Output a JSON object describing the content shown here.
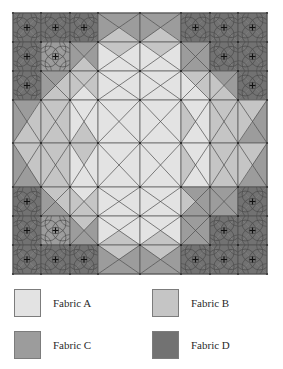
{
  "fabrics": {
    "A": {
      "label": "Fabric A",
      "color": "#e3e3e3"
    },
    "B": {
      "label": "Fabric B",
      "color": "#c5c5c5"
    },
    "C": {
      "label": "Fabric C",
      "color": "#9c9c9c"
    },
    "D": {
      "label": "Fabric D",
      "color": "#727272"
    }
  },
  "quilt": {
    "x_edges": [
      13,
      41,
      70,
      98,
      140,
      181,
      210,
      238,
      267
    ],
    "y_edges": [
      13,
      42,
      71,
      100,
      143,
      187,
      216,
      245,
      274
    ],
    "line_color": "#4a4a4a",
    "cells": [
      [
        {
          "t": "o",
          "f": "DDDD"
        },
        {
          "t": "o",
          "f": "DDDD"
        },
        {
          "t": "o",
          "f": "DDDD"
        },
        {
          "t": "x",
          "f": "CCBC"
        },
        {
          "t": "x",
          "f": "CCBC"
        },
        {
          "t": "o",
          "f": "DDDD"
        },
        {
          "t": "o",
          "f": "DDDD"
        },
        {
          "t": "o",
          "f": "DDDD"
        }
      ],
      [
        {
          "t": "o",
          "f": "DDDD"
        },
        {
          "t": "o",
          "f": "CCCC"
        },
        {
          "t": "x",
          "f": "CCBC"
        },
        {
          "t": "x",
          "f": "BAAA"
        },
        {
          "t": "x",
          "f": "BAAA"
        },
        {
          "t": "x",
          "f": "CCCC"
        },
        {
          "t": "o",
          "f": "DDDD"
        },
        {
          "t": "o",
          "f": "DDDD"
        }
      ],
      [
        {
          "t": "o",
          "f": "DDDD"
        },
        {
          "t": "x",
          "f": "CBBC"
        },
        {
          "t": "x",
          "f": "BBAB"
        },
        {
          "t": "x",
          "f": "AAAA"
        },
        {
          "t": "x",
          "f": "AAAA"
        },
        {
          "t": "x",
          "f": "BBAA"
        },
        {
          "t": "x",
          "f": "CCBB"
        },
        {
          "t": "o",
          "f": "DDDD"
        }
      ],
      [
        {
          "t": "x",
          "f": "CBBC"
        },
        {
          "t": "x",
          "f": "BBBB"
        },
        {
          "t": "x",
          "f": "AABA"
        },
        {
          "t": "x",
          "f": "AAAA"
        },
        {
          "t": "x",
          "f": "AAAA"
        },
        {
          "t": "x",
          "f": "AAAB"
        },
        {
          "t": "x",
          "f": "BBBB"
        },
        {
          "t": "x",
          "f": "BCCB"
        }
      ],
      [
        {
          "t": "x",
          "f": "BBCC"
        },
        {
          "t": "x",
          "f": "BBBB"
        },
        {
          "t": "x",
          "f": "BAAA"
        },
        {
          "t": "x",
          "f": "AAAA"
        },
        {
          "t": "x",
          "f": "AAAA"
        },
        {
          "t": "x",
          "f": "AAAB"
        },
        {
          "t": "x",
          "f": "BBBB"
        },
        {
          "t": "x",
          "f": "BCCB"
        }
      ],
      [
        {
          "t": "o",
          "f": "DDDD"
        },
        {
          "t": "x",
          "f": "BBCC"
        },
        {
          "t": "x",
          "f": "ABBB"
        },
        {
          "t": "x",
          "f": "AAAA"
        },
        {
          "t": "x",
          "f": "AAAA"
        },
        {
          "t": "x",
          "f": "CCCB"
        },
        {
          "t": "x",
          "f": "CCCC"
        },
        {
          "t": "o",
          "f": "DDDD"
        }
      ],
      [
        {
          "t": "o",
          "f": "DDDD"
        },
        {
          "t": "o",
          "f": "CCCC"
        },
        {
          "t": "x",
          "f": "BCCC"
        },
        {
          "t": "x",
          "f": "AABA"
        },
        {
          "t": "x",
          "f": "AABA"
        },
        {
          "t": "x",
          "f": "CCCC"
        },
        {
          "t": "o",
          "f": "DDDD"
        },
        {
          "t": "o",
          "f": "DDDD"
        }
      ],
      [
        {
          "t": "o",
          "f": "DDDD"
        },
        {
          "t": "o",
          "f": "DDDD"
        },
        {
          "t": "o",
          "f": "DDDD"
        },
        {
          "t": "x",
          "f": "BCCC"
        },
        {
          "t": "x",
          "f": "BCCC"
        },
        {
          "t": "o",
          "f": "DDDD"
        },
        {
          "t": "o",
          "f": "DDDD"
        },
        {
          "t": "o",
          "f": "DDDD"
        }
      ]
    ]
  },
  "legend": [
    {
      "key": "A",
      "label": "Fabric A"
    },
    {
      "key": "B",
      "label": "Fabric B"
    },
    {
      "key": "C",
      "label": "Fabric C"
    },
    {
      "key": "D",
      "label": "Fabric D"
    }
  ]
}
